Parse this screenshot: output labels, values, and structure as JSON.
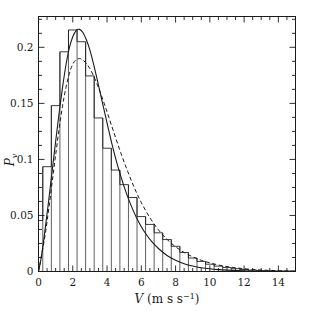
{
  "figure": {
    "background": "#ffffff",
    "ink": "#1a1a1a"
  },
  "chart_data": {
    "type": "bar",
    "title": "",
    "subtitle": "",
    "xlabel": "V (m s⁻¹)",
    "xlabel_parts": {
      "symbol": "V",
      "units_open": "(m s",
      "units_exponent": "−1",
      "units_close": ")"
    },
    "ylabel": "P",
    "ylabel_sub": "v",
    "xlim": [
      0,
      15
    ],
    "ylim": [
      0,
      0.2275
    ],
    "grid": false,
    "legend": null,
    "x_ticks_major": [
      0,
      2,
      4,
      6,
      8,
      10,
      12,
      14
    ],
    "x_tick_labels": [
      "0",
      "2",
      "4",
      "6",
      "8",
      "10",
      "12",
      "14"
    ],
    "x_ticks_minor": [
      0.5,
      1,
      1.5,
      2.5,
      3,
      3.5,
      4.5,
      5,
      5.5,
      6.5,
      7,
      7.5,
      8.5,
      9,
      9.5,
      10.5,
      11,
      11.5,
      12.5,
      13,
      13.5,
      14.5,
      15
    ],
    "y_ticks_major": [
      0,
      0.05,
      0.1,
      0.15,
      0.2
    ],
    "y_tick_labels": [
      "0",
      "0.05",
      "0.1",
      "0.15",
      "0.2"
    ],
    "y_ticks_minor": [
      0.0125,
      0.025,
      0.0375,
      0.0625,
      0.075,
      0.0875,
      0.1125,
      0.125,
      0.1375,
      0.1625,
      0.175,
      0.1875,
      0.2125,
      0.225
    ],
    "bin_width": 0.5,
    "histogram": {
      "name": "Observed wind speed histogram",
      "bin_edges": [
        0.0,
        0.25,
        0.75,
        1.25,
        1.75,
        2.25,
        2.75,
        3.25,
        3.75,
        4.25,
        4.75,
        5.25,
        5.75,
        6.25,
        6.75,
        7.25,
        7.75,
        8.25,
        8.75,
        9.25,
        9.75,
        10.25,
        10.75,
        11.25,
        11.75,
        12.25,
        12.75,
        13.25,
        13.75,
        14.25,
        14.75,
        15.0
      ],
      "values": [
        0.0455,
        0.0935,
        0.148,
        0.196,
        0.2155,
        0.205,
        0.1745,
        0.137,
        0.11,
        0.0905,
        0.0775,
        0.066,
        0.049,
        0.042,
        0.0345,
        0.0285,
        0.0225,
        0.017,
        0.012,
        0.009,
        0.0065,
        0.0048,
        0.0035,
        0.0025,
        0.0018,
        0.0012,
        0.0008,
        0.0006,
        0.0004,
        0.0003,
        0.0002
      ]
    },
    "series": [
      {
        "name": "Weibull fit",
        "style": "solid",
        "linewidth": 1.1,
        "color": "#1a1a1a",
        "x": [
          0.0,
          0.15,
          0.3,
          0.45,
          0.6,
          0.8,
          1.0,
          1.2,
          1.4,
          1.6,
          1.8,
          2.0,
          2.2,
          2.4,
          2.6,
          2.8,
          3.0,
          3.2,
          3.4,
          3.6,
          3.8,
          4.0,
          4.3,
          4.6,
          5.0,
          5.4,
          5.8,
          6.2,
          6.6,
          7.0,
          7.5,
          8.0,
          8.5,
          9.0,
          9.5,
          10.0,
          10.5,
          11.0,
          11.5,
          12.0,
          12.5,
          13.0,
          13.5,
          14.0,
          14.5,
          15.0
        ],
        "y": [
          0.0,
          0.0115,
          0.0275,
          0.0455,
          0.064,
          0.09,
          0.116,
          0.141,
          0.164,
          0.184,
          0.1995,
          0.2095,
          0.215,
          0.216,
          0.213,
          0.2065,
          0.1975,
          0.186,
          0.173,
          0.1595,
          0.146,
          0.1325,
          0.113,
          0.0955,
          0.0755,
          0.059,
          0.0455,
          0.035,
          0.0268,
          0.0205,
          0.0143,
          0.01,
          0.007,
          0.0049,
          0.0034,
          0.0024,
          0.0017,
          0.0012,
          0.0009,
          0.0006,
          0.0004,
          0.0003,
          0.0002,
          0.0002,
          0.0001,
          0.0001
        ]
      },
      {
        "name": "Alternative fit",
        "style": "dashed",
        "linewidth": 1.0,
        "color": "#1a1a1a",
        "x": [
          0.0,
          0.2,
          0.4,
          0.6,
          0.8,
          1.0,
          1.2,
          1.4,
          1.6,
          1.8,
          2.0,
          2.2,
          2.4,
          2.6,
          2.8,
          3.0,
          3.2,
          3.4,
          3.6,
          3.8,
          4.0,
          4.4,
          4.8,
          5.2,
          5.6,
          6.0,
          6.5,
          7.0,
          7.5,
          8.0,
          8.5,
          9.0,
          9.5,
          10.0,
          10.5,
          11.0,
          11.5,
          12.0,
          12.5,
          13.0,
          13.5,
          14.0,
          14.5,
          15.0
        ],
        "y": [
          0.0,
          0.016,
          0.034,
          0.056,
          0.08,
          0.104,
          0.127,
          0.1475,
          0.164,
          0.1765,
          0.185,
          0.189,
          0.19,
          0.1885,
          0.1855,
          0.181,
          0.175,
          0.168,
          0.16,
          0.1515,
          0.1425,
          0.124,
          0.106,
          0.0895,
          0.0745,
          0.0615,
          0.048,
          0.0372,
          0.0287,
          0.0221,
          0.017,
          0.0131,
          0.01,
          0.0077,
          0.0058,
          0.0044,
          0.0033,
          0.0025,
          0.0018,
          0.0013,
          0.001,
          0.0007,
          0.0005,
          0.0003
        ]
      }
    ]
  }
}
